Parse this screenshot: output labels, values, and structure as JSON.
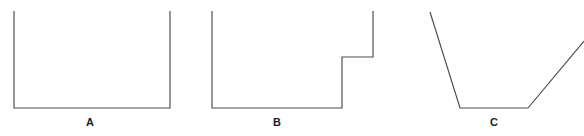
{
  "figure": {
    "background_color": "#ffffff",
    "stroke_color": "#4a4a4a",
    "label_color": "#1d1d1d",
    "width": 584,
    "height": 136,
    "caption": ""
  },
  "shapes": [
    {
      "id": "A",
      "label": "A",
      "description": "straight-sided rectangular open container",
      "points": "14,11 14,108 170,108 170,11"
    },
    {
      "id": "B",
      "label": "B",
      "description": "stepped open container with raised ledge on right side",
      "points": "212,11 212,108 342,108 342,57 373,57 373,11"
    },
    {
      "id": "C",
      "label": "C",
      "description": "open funnel shaped container with outward slanting walls",
      "points": "430,12 460,108 528,108 584,41"
    }
  ],
  "labels": {
    "a": "A",
    "b": "B",
    "c": "C"
  }
}
